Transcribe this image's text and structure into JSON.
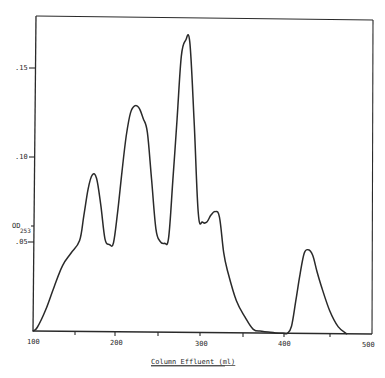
{
  "chart_data": {
    "type": "line",
    "title": "",
    "xlabel": "Column Effluent (ml)",
    "ylabel": "OD253",
    "xlim": [
      100,
      500
    ],
    "ylim": [
      0,
      0.175
    ],
    "grid": false,
    "x_ticks": [
      "100",
      "200",
      "300",
      "400",
      "500"
    ],
    "y_ticks": [
      ".05",
      ".10",
      ".15"
    ],
    "y_axis_annotation": {
      "main": "OD",
      "sub": "253"
    },
    "series": [
      {
        "name": "OD253",
        "x": [
          100,
          105,
          115,
          125,
          135,
          145,
          155,
          160,
          165,
          170,
          175,
          180,
          185,
          190,
          195,
          200,
          205,
          210,
          215,
          220,
          225,
          230,
          235,
          240,
          245,
          250,
          255,
          260,
          265,
          270,
          275,
          280,
          285,
          290,
          295,
          300,
          305,
          310,
          315,
          320,
          325,
          330,
          340,
          350,
          360,
          370,
          380,
          390,
          395,
          400,
          405,
          410,
          415,
          420,
          425,
          430,
          435,
          440,
          450,
          460,
          470
        ],
        "values": [
          0.0,
          0.002,
          0.012,
          0.025,
          0.037,
          0.044,
          0.051,
          0.065,
          0.08,
          0.088,
          0.086,
          0.071,
          0.052,
          0.049,
          0.05,
          0.068,
          0.09,
          0.11,
          0.123,
          0.127,
          0.126,
          0.12,
          0.112,
          0.085,
          0.058,
          0.051,
          0.05,
          0.053,
          0.085,
          0.12,
          0.155,
          0.164,
          0.163,
          0.12,
          0.067,
          0.062,
          0.062,
          0.066,
          0.068,
          0.065,
          0.045,
          0.034,
          0.018,
          0.009,
          0.002,
          0.001,
          0.0005,
          0.0,
          0.0,
          0.0,
          0.004,
          0.018,
          0.033,
          0.045,
          0.047,
          0.044,
          0.035,
          0.027,
          0.013,
          0.004,
          0.0
        ]
      }
    ]
  },
  "axes": {
    "x_title": "Column Effluent (ml)",
    "y_tick_labels": [
      ".15",
      ".10",
      ".05"
    ],
    "x_tick_labels": [
      "100",
      "200",
      "300",
      "400",
      "500"
    ],
    "od_label_main": "OD",
    "od_label_sub": "253"
  },
  "colors": {
    "ink": "#2a2a2a",
    "background": "#ffffff"
  }
}
